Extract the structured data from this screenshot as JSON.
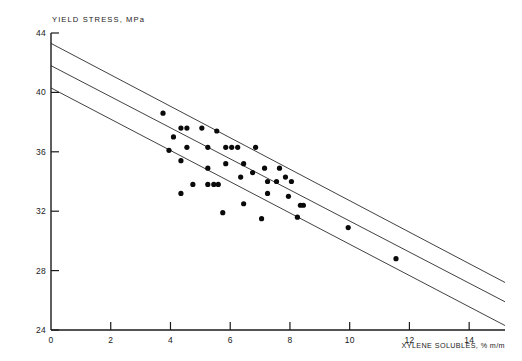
{
  "chart_data": {
    "type": "scatter",
    "title": "",
    "xlabel": "XYLENE SOLUBLES, % m/m",
    "ylabel": "YIELD STRESS, MPa",
    "xlim": [
      0,
      15.2
    ],
    "ylim": [
      24,
      44
    ],
    "xticks": [
      0,
      2,
      4,
      6,
      8,
      10,
      12,
      14
    ],
    "yticks": [
      24,
      28,
      32,
      36,
      40,
      44
    ],
    "xtick_labels": [
      "0",
      "2",
      "4",
      "6",
      "8",
      "10",
      "12",
      "14"
    ],
    "ytick_labels": [
      "24",
      "28",
      "32",
      "36",
      "40",
      "44"
    ],
    "grid": false,
    "legend": "none",
    "marker": "filled-circle",
    "marker_color": "#0a0a0a",
    "line_color": "#2b2b2b",
    "axis_color": "#1a1a1a",
    "background": "#ffffff",
    "series": [
      {
        "name": "Observations",
        "points": [
          [
            3.75,
            38.6
          ],
          [
            4.35,
            37.6
          ],
          [
            4.55,
            37.6
          ],
          [
            4.1,
            37.0
          ],
          [
            3.95,
            36.1
          ],
          [
            5.05,
            37.6
          ],
          [
            5.55,
            37.4
          ],
          [
            4.55,
            36.3
          ],
          [
            4.35,
            35.4
          ],
          [
            5.25,
            36.3
          ],
          [
            5.85,
            36.3
          ],
          [
            6.05,
            36.3
          ],
          [
            6.25,
            36.3
          ],
          [
            6.85,
            36.3
          ],
          [
            5.25,
            34.9
          ],
          [
            5.85,
            35.2
          ],
          [
            6.45,
            35.2
          ],
          [
            6.75,
            34.6
          ],
          [
            4.75,
            33.8
          ],
          [
            5.25,
            33.8
          ],
          [
            5.45,
            33.8
          ],
          [
            5.6,
            33.8
          ],
          [
            4.35,
            33.2
          ],
          [
            6.35,
            34.3
          ],
          [
            7.15,
            34.9
          ],
          [
            7.65,
            34.9
          ],
          [
            7.25,
            34.0
          ],
          [
            7.55,
            34.0
          ],
          [
            7.85,
            34.3
          ],
          [
            8.05,
            34.0
          ],
          [
            7.25,
            33.2
          ],
          [
            7.95,
            33.0
          ],
          [
            6.45,
            32.5
          ],
          [
            5.75,
            31.9
          ],
          [
            7.05,
            31.5
          ],
          [
            8.25,
            31.6
          ],
          [
            8.35,
            32.4
          ],
          [
            8.45,
            32.4
          ],
          [
            11.55,
            28.8
          ],
          [
            9.95,
            30.9
          ]
        ]
      }
    ],
    "fit_lines": [
      {
        "name": "upper-band",
        "x0": 0.0,
        "y0": 43.3,
        "x1": 15.2,
        "y1": 27.2
      },
      {
        "name": "center-fit",
        "x0": 0.0,
        "y0": 41.8,
        "x1": 15.2,
        "y1": 25.9
      },
      {
        "name": "lower-band",
        "x0": 0.0,
        "y0": 40.3,
        "x1": 15.2,
        "y1": 24.3
      }
    ]
  }
}
